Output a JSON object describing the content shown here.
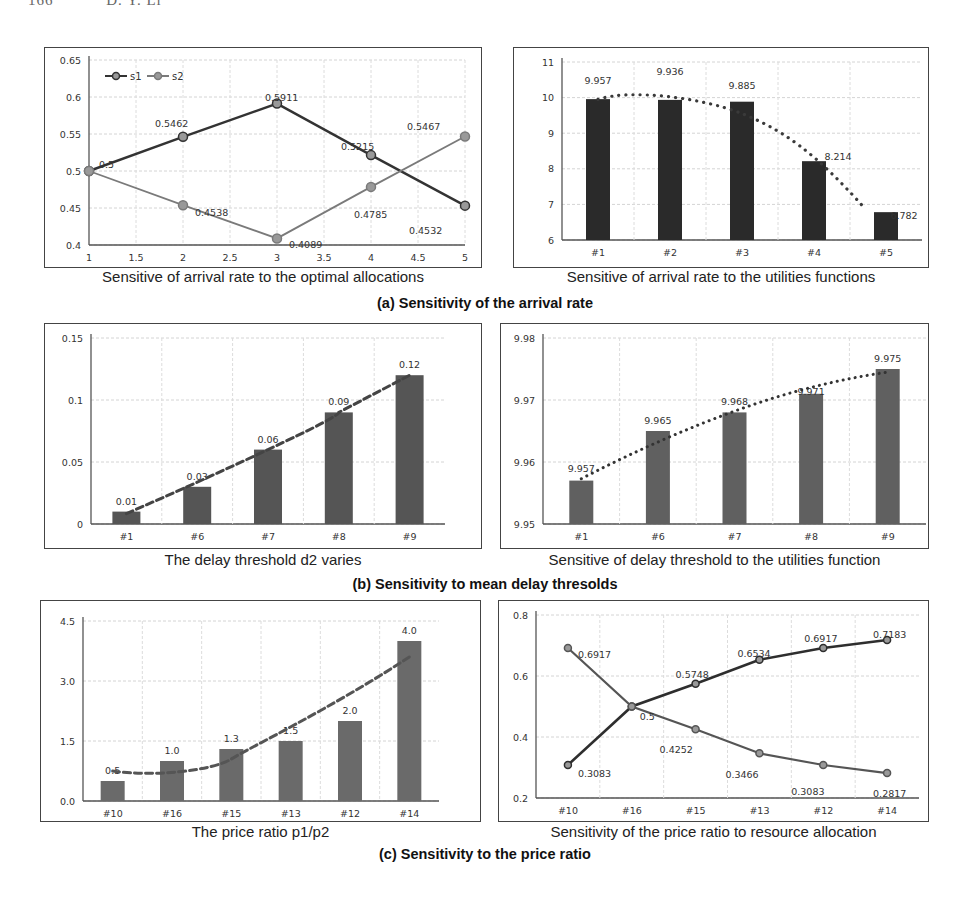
{
  "page_header": {
    "page_number": "166",
    "author": "D. Y. Li"
  },
  "groups": [
    {
      "caption": "(a) Sensitivity of the arrival rate"
    },
    {
      "caption": "(b) Sensitivity to mean delay thresolds"
    },
    {
      "caption": "(c) Sensitivity to the price ratio"
    }
  ],
  "chart_data": [
    {
      "id": "a-left",
      "type": "line",
      "title": "Sensitive of arrival rate to the optimal allocations",
      "x": [
        1,
        2,
        3,
        4,
        5
      ],
      "xticks": [
        "1",
        "1.5",
        "2",
        "2.5",
        "3",
        "3.5",
        "4",
        "4.5",
        "5"
      ],
      "ylim": [
        0.4,
        0.65
      ],
      "yticks": [
        "0.4",
        "0.45",
        "0.5",
        "0.55",
        "0.6",
        "0.65"
      ],
      "grid": true,
      "legend": {
        "position": "top-left",
        "entries": [
          "s1",
          "s2"
        ]
      },
      "series": [
        {
          "name": "s1",
          "color": "#333333",
          "values": [
            0.5,
            0.5462,
            0.5911,
            0.5215,
            0.4532
          ]
        },
        {
          "name": "s2",
          "color": "#7a7a7a",
          "values": [
            0.5,
            0.4538,
            0.4089,
            0.4785,
            0.5467
          ]
        }
      ],
      "labels": [
        "0.5",
        "0.5462",
        "0.5911",
        "0.5215",
        "0.4532",
        "0.4538",
        "0.4089",
        "0.4785",
        "0.5467"
      ]
    },
    {
      "id": "a-right",
      "type": "bar",
      "title": "Sensitive of arrival rate to the utilities functions",
      "categories": [
        "#1",
        "#2",
        "#3",
        "#4",
        "#5"
      ],
      "values": [
        9.957,
        9.936,
        9.885,
        8.214,
        6.782
      ],
      "ylim": [
        6,
        11
      ],
      "yticks": [
        "6",
        "7",
        "8",
        "9",
        "10",
        "11"
      ],
      "bar_color": "#2a2a2a",
      "trendline": "dotted polynomial",
      "grid": true
    },
    {
      "id": "b-left",
      "type": "bar",
      "title": "The delay threshold d2 varies",
      "categories": [
        "#1",
        "#6",
        "#7",
        "#8",
        "#9"
      ],
      "values": [
        0.01,
        0.03,
        0.06,
        0.09,
        0.12
      ],
      "labels": [
        "0.01",
        "0.03",
        "0.06",
        "0.09",
        "0.12"
      ],
      "ylim": [
        0,
        0.15
      ],
      "yticks": [
        "0",
        "0.05",
        "0.1",
        "0.15"
      ],
      "bar_color": "#555555",
      "trendline": "dashed polynomial",
      "grid": true
    },
    {
      "id": "b-right",
      "type": "bar",
      "title": "Sensitive of delay threshold to the utilities function",
      "categories": [
        "#1",
        "#6",
        "#7",
        "#8",
        "#9"
      ],
      "values": [
        9.957,
        9.965,
        9.968,
        9.971,
        9.975
      ],
      "labels": [
        "9.957",
        "9.965",
        "9.968",
        "9.971",
        "9.975"
      ],
      "ylim": [
        9.95,
        9.98
      ],
      "yticks": [
        "9.95",
        "9.96",
        "9.97",
        "9.98"
      ],
      "bar_color": "#606060",
      "trendline": "dotted logarithmic",
      "grid": true
    },
    {
      "id": "c-left",
      "type": "bar",
      "title": "The price ratio p1/p2",
      "categories": [
        "#10",
        "#16",
        "#15",
        "#13",
        "#12",
        "#14"
      ],
      "values": [
        0.5,
        1.0,
        1.3,
        1.5,
        2.0,
        4.0
      ],
      "labels": [
        "0.5",
        "1.0",
        "1.3",
        "1.5",
        "2.0",
        "4.0"
      ],
      "ylim": [
        0,
        4.5
      ],
      "yticks": [
        "0.0",
        "1.5",
        "3.0",
        "4.5"
      ],
      "bar_color": "#6a6a6a",
      "trendline": "dashed polynomial",
      "grid": true
    },
    {
      "id": "c-right",
      "type": "line",
      "title": "Sensitivity of the price ratio to resource allocation",
      "categories": [
        "#10",
        "#16",
        "#15",
        "#13",
        "#12",
        "#14"
      ],
      "ylim": [
        0.2,
        0.8
      ],
      "yticks": [
        "0.2",
        "0.4",
        "0.6",
        "0.8"
      ],
      "grid": true,
      "series": [
        {
          "name": "rising",
          "color": "#2e2e2e",
          "values": [
            0.3083,
            0.5,
            0.5748,
            0.6534,
            0.6917,
            0.7183
          ]
        },
        {
          "name": "falling",
          "color": "#555555",
          "values": [
            0.6917,
            0.5,
            0.4252,
            0.3466,
            0.3083,
            0.2817
          ]
        }
      ],
      "labels": [
        "0.3083",
        "0.5",
        "0.5748",
        "0.6534",
        "0.6917",
        "0.7183",
        "0.6917",
        "0.4252",
        "0.3466",
        "0.3083",
        "0.2817"
      ]
    }
  ],
  "captions": {
    "a_left": "Sensitive of arrival rate to the optimal allocations",
    "a_right": "Sensitive of arrival rate to the utilities functions",
    "b_left": "The delay threshold d2 varies",
    "b_right": "Sensitive of delay threshold to the utilities function",
    "c_left": "The price ratio p1/p2",
    "c_right": "Sensitivity of the price ratio to resource allocation"
  }
}
